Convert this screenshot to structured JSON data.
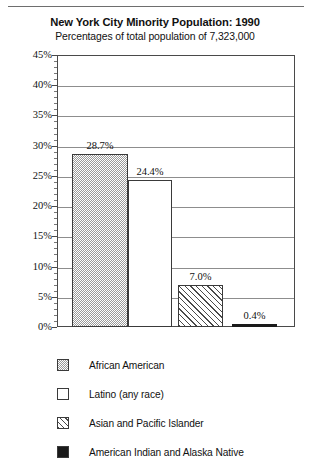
{
  "chart_data": {
    "type": "bar",
    "title": "New York City Minority Population: 1990",
    "subtitle": "Percentages of total population of 7,323,000",
    "xlabel": "",
    "ylabel": "",
    "ylim": [
      0,
      45
    ],
    "ytick_step": 5,
    "yminor_step": 1,
    "grid": true,
    "legend_position": "bottom-left",
    "categories": [
      "African American",
      "Latino (any race)",
      "Asian and Pacific Islander",
      "American Indian and Alaska Native"
    ],
    "values": [
      28.7,
      24.4,
      7.0,
      0.4
    ],
    "value_labels": [
      "28.7%",
      "24.4%",
      "7.0%",
      "0.4%"
    ],
    "ytick_labels": [
      "45%",
      "40%",
      "35%",
      "30%",
      "25%",
      "20%",
      "15%",
      "10%",
      "5%",
      "0%"
    ],
    "ytick_values": [
      45,
      40,
      35,
      30,
      25,
      20,
      15,
      10,
      5,
      0
    ],
    "bar_patterns": [
      "stipple",
      "white",
      "diagonal-hatch",
      "solid-black"
    ],
    "colors": {
      "frame": "#4a4a4a",
      "gridline": "#8d8d8d",
      "bar_outline": "#3a3a3a",
      "stipple": "#9a9a9a",
      "solid": "#1a1a1a",
      "background": "#ffffff",
      "text": "#111111"
    }
  },
  "legend": {
    "items": [
      {
        "label": "African American",
        "pattern": "stipple"
      },
      {
        "label": "Latino (any race)",
        "pattern": "white"
      },
      {
        "label": "Asian and Pacific Islander",
        "pattern": "diagonal-hatch"
      },
      {
        "label": "American Indian and Alaska Native",
        "pattern": "solid-black"
      }
    ]
  }
}
